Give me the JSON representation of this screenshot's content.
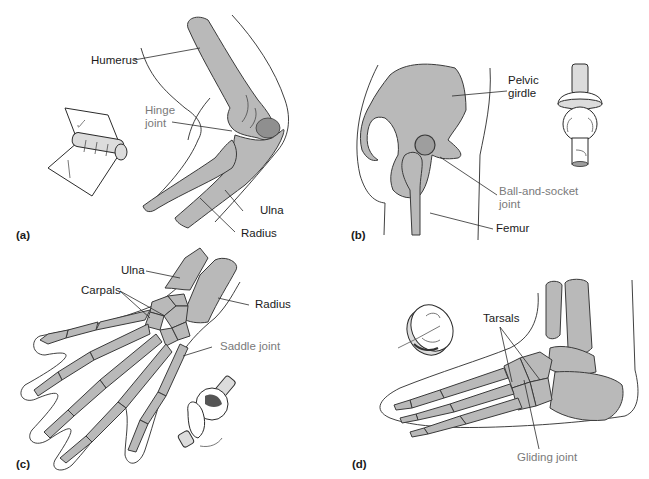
{
  "figure": {
    "colors": {
      "bone_fill": "#b9b9b9",
      "bone_stroke": "#3a3a3a",
      "outline": "#2b2b2b",
      "label_text": "#1a1a1a",
      "joint_label_text": "#7a7a7a"
    },
    "panels": [
      {
        "id": "a",
        "panel_label": "(a)",
        "joint_type": "Hinge joint",
        "labels": {
          "humerus": "Humerus",
          "hinge_joint_line1": "Hinge",
          "hinge_joint_line2": "joint",
          "ulna": "Ulna",
          "radius": "Radius"
        },
        "model_icon": "hinge-model"
      },
      {
        "id": "b",
        "panel_label": "(b)",
        "joint_type": "Ball-and-socket joint",
        "labels": {
          "pelvic_line1": "Pelvic",
          "pelvic_line2": "girdle",
          "ball_line1": "Ball-and-socket",
          "ball_line2": "joint",
          "femur": "Femur"
        },
        "model_icon": "ball-and-socket-model"
      },
      {
        "id": "c",
        "panel_label": "(c)",
        "joint_type": "Saddle joint",
        "labels": {
          "ulna": "Ulna",
          "carpals": "Carpals",
          "radius": "Radius",
          "saddle_joint": "Saddle joint"
        },
        "model_icon": "saddle-model"
      },
      {
        "id": "d",
        "panel_label": "(d)",
        "joint_type": "Gliding joint",
        "labels": {
          "tarsals": "Tarsals",
          "gliding_joint": "Gliding joint"
        },
        "model_icon": "gliding-model"
      }
    ]
  }
}
